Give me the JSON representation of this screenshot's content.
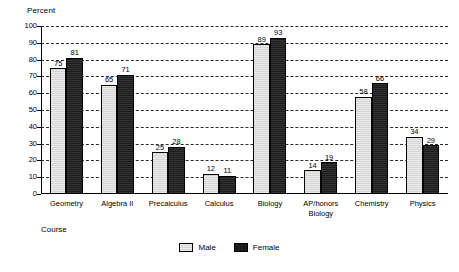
{
  "chart_data": {
    "type": "bar",
    "title": "",
    "ylabel": "Percent",
    "xlabel": "Course",
    "ylim": [
      0,
      100
    ],
    "ytick_step": 10,
    "yticks": [
      "0",
      "10",
      "20",
      "30",
      "40",
      "50",
      "60",
      "70",
      "80",
      "90",
      "100"
    ],
    "grid": "horizontal dashed gridlines at every 10 percent",
    "legend_position": "bottom-center",
    "categories": [
      "Geometry",
      "Algebra II",
      "Precalculus",
      "Calculus",
      "Biology",
      "AP/honors\nBiology",
      "Chemistry",
      "Physics"
    ],
    "series": [
      {
        "name": "Male",
        "color": "#d4d4d4",
        "values": [
          75,
          65,
          25,
          12,
          89,
          14,
          58,
          34
        ]
      },
      {
        "name": "Female",
        "color": "#1c1c1c",
        "values": [
          81,
          71,
          28,
          11,
          93,
          19,
          66,
          29
        ]
      }
    ]
  },
  "legend": {
    "items": [
      {
        "label": "Male"
      },
      {
        "label": "Female"
      }
    ]
  }
}
